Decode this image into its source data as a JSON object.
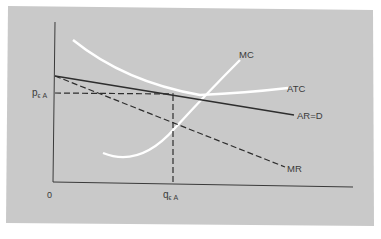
{
  "diagram": {
    "type": "economics-cost-revenue",
    "background_color": "#c9c9c9",
    "axis_color": "#3a3a3a",
    "curve_white": "#ffffff",
    "origin_label": "0",
    "price_label": "p",
    "price_subscript": "ϵ A",
    "quantity_label": "q",
    "quantity_subscript": "ϵ A",
    "curves": {
      "mc": {
        "label": "MC",
        "style": "white-solid"
      },
      "atc": {
        "label": "ATC",
        "style": "white-solid"
      },
      "ar": {
        "label": "AR=D",
        "style": "dark-solid"
      },
      "mr": {
        "label": "MR",
        "style": "dark-dashed"
      }
    },
    "guides": {
      "price_line": "dashed horizontal from price axis to AR=D at equilibrium quantity",
      "quantity_line": "dashed vertical from AR=D down to quantity axis"
    }
  }
}
